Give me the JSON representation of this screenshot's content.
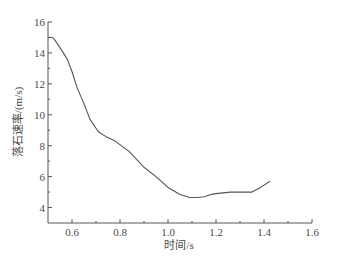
{
  "chart_data": {
    "type": "line",
    "title": "",
    "xlabel": "时间/s",
    "ylabel": "落石速率/(m/s)",
    "xlim": [
      0.5,
      1.6
    ],
    "ylim": [
      3,
      16
    ],
    "x_ticks": [
      0.6,
      0.8,
      1.0,
      1.2,
      1.4,
      1.6
    ],
    "x_tick_labels": [
      "0.6",
      "0.8",
      "1.0",
      "1.2",
      "1.4",
      "1.6"
    ],
    "x_minor_ticks": [
      0.7,
      0.9,
      1.1,
      1.3,
      1.5
    ],
    "y_ticks": [
      4,
      6,
      8,
      10,
      12,
      14,
      16
    ],
    "y_tick_labels": [
      "4",
      "6",
      "8",
      "10",
      "12",
      "14",
      "16"
    ],
    "y_minor_ticks": [
      5,
      7,
      9,
      11,
      13,
      15
    ],
    "grid": false,
    "legend": null,
    "series": [
      {
        "name": "落石速率",
        "color": "#555555",
        "x": [
          0.5,
          0.52,
          0.53,
          0.56,
          0.58,
          0.6,
          0.62,
          0.65,
          0.675,
          0.71,
          0.74,
          0.78,
          0.84,
          0.87,
          0.9,
          0.95,
          1.0,
          1.05,
          1.09,
          1.12,
          1.15,
          1.18,
          1.2,
          1.26,
          1.3,
          1.35,
          1.38,
          1.4,
          1.425
        ],
        "y": [
          15.0,
          15.0,
          14.8,
          14.1,
          13.6,
          12.8,
          11.8,
          10.7,
          9.7,
          8.9,
          8.6,
          8.3,
          7.6,
          7.1,
          6.6,
          6.0,
          5.3,
          4.85,
          4.65,
          4.65,
          4.7,
          4.85,
          4.9,
          5.0,
          5.0,
          5.0,
          5.25,
          5.45,
          5.7
        ]
      }
    ]
  }
}
